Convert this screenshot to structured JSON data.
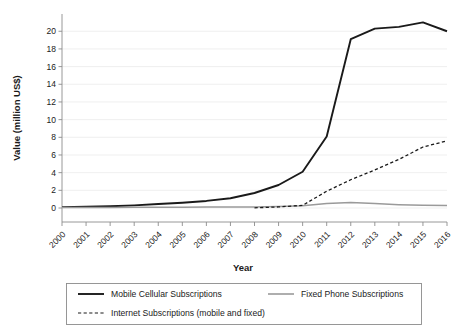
{
  "chart_data": {
    "type": "line",
    "title": "",
    "xlabel": "Year",
    "ylabel": "Value (million US$)",
    "x": [
      2000,
      2001,
      2002,
      2003,
      2004,
      2005,
      2006,
      2007,
      2008,
      2009,
      2010,
      2011,
      2012,
      2013,
      2014,
      2015,
      2016
    ],
    "categories": [
      "2000",
      "2001",
      "2002",
      "2003",
      "2004",
      "2005",
      "2006",
      "2007",
      "2008",
      "2009",
      "2010",
      "2011",
      "2012",
      "2013",
      "2014",
      "2015",
      "2016"
    ],
    "xlim": [
      2000,
      2016
    ],
    "ylim": [
      0,
      21.5
    ],
    "yticks": [
      0,
      2,
      4,
      6,
      8,
      10,
      12,
      14,
      16,
      18,
      20
    ],
    "ytick_labels": [
      "0",
      "2",
      "4",
      "6",
      "8",
      "10",
      "12",
      "14",
      "16",
      "18",
      "20"
    ],
    "grid": true,
    "grid_axis": "y",
    "legend_position": "below-outside",
    "series": [
      {
        "name": "Mobile Cellular Subscriptions",
        "style": "solid",
        "color": "#1a1a1a",
        "width": 1.9,
        "values": [
          0.1,
          0.15,
          0.2,
          0.3,
          0.45,
          0.6,
          0.8,
          1.1,
          1.7,
          2.6,
          4.1,
          8.1,
          19.1,
          20.3,
          20.5,
          21.0,
          20.0
        ]
      },
      {
        "name": "Fixed Phone Subscriptions",
        "style": "solid",
        "color": "#9a9a9a",
        "width": 1.5,
        "values": [
          0.06,
          0.07,
          0.07,
          0.08,
          0.08,
          0.09,
          0.1,
          0.1,
          0.12,
          0.16,
          0.25,
          0.5,
          0.62,
          0.5,
          0.38,
          0.3,
          0.27
        ]
      },
      {
        "name": "Internet Subscriptions (mobile and fixed)",
        "style": "dashed",
        "color": "#1a1a1a",
        "width": 1.3,
        "start_index": 8,
        "values": [
          null,
          null,
          null,
          null,
          null,
          null,
          null,
          null,
          0.02,
          0.12,
          0.3,
          1.9,
          3.2,
          4.3,
          5.5,
          6.9,
          7.6
        ]
      }
    ]
  },
  "axes": {
    "x_title": "Year",
    "y_title": "Value (million US$)"
  },
  "legend": {
    "entries": [
      {
        "label": "Mobile Cellular Subscriptions",
        "style": "solid",
        "color": "#1a1a1a"
      },
      {
        "label": "Fixed Phone Subscriptions",
        "style": "solid",
        "color": "#9a9a9a"
      },
      {
        "label": "Internet Subscriptions (mobile and fixed)",
        "style": "dashed",
        "color": "#1a1a1a"
      }
    ]
  }
}
